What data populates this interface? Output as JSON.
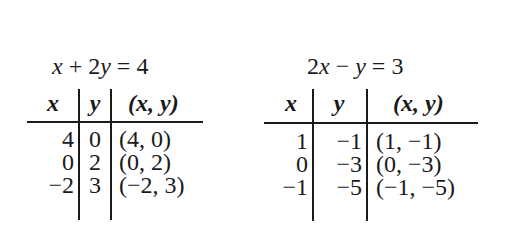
{
  "tables": [
    {
      "equation": "x + 2y = 4",
      "equation_parts": [
        "x",
        " + 2",
        "y",
        " = 4"
      ],
      "headers": [
        "x",
        "y",
        "(x, y)"
      ],
      "rows": [
        {
          "x": "4",
          "y": "0",
          "pair": "(4, 0)"
        },
        {
          "x": "0",
          "y": "2",
          "pair": "(0, 2)"
        },
        {
          "x": "−2",
          "y": "3",
          "pair": "(−2, 3)"
        }
      ]
    },
    {
      "equation": "2x − y = 3",
      "equation_parts": [
        "2",
        "x",
        " − ",
        "y",
        " = 3"
      ],
      "headers": [
        "x",
        "y",
        "(x, y)"
      ],
      "rows": [
        {
          "x": "1",
          "y": "−1",
          "pair": "(1, −1)"
        },
        {
          "x": "0",
          "y": "−3",
          "pair": "(0, −3)"
        },
        {
          "x": "−1",
          "y": "−5",
          "pair": "(−1, −5)"
        }
      ]
    }
  ]
}
